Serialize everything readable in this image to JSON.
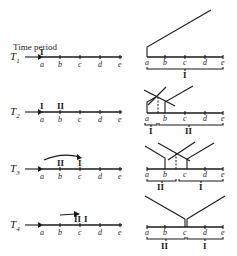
{
  "title": "Time period",
  "points": [
    "a",
    "b",
    "c",
    "d",
    "e"
  ],
  "rows": [
    {
      "id": "T1",
      "label": "T",
      "sub": "1",
      "left_markers": [
        "I"
      ],
      "right_brackets": [
        "I"
      ]
    },
    {
      "id": "T2",
      "label": "T",
      "sub": "2",
      "left_markers": [
        "I",
        "II"
      ],
      "right_brackets": [
        "I",
        "II"
      ]
    },
    {
      "id": "T3",
      "label": "T",
      "sub": "3",
      "left_markers": [
        "II",
        "I"
      ],
      "right_brackets": [
        "II",
        "I"
      ]
    },
    {
      "id": "T4",
      "label": "T",
      "sub": "4",
      "left_markers": [
        "II",
        "I"
      ],
      "right_brackets": [
        "II",
        "I"
      ]
    }
  ],
  "colors": {
    "ink": "#1a1a1a",
    "background": "#ffffff"
  }
}
